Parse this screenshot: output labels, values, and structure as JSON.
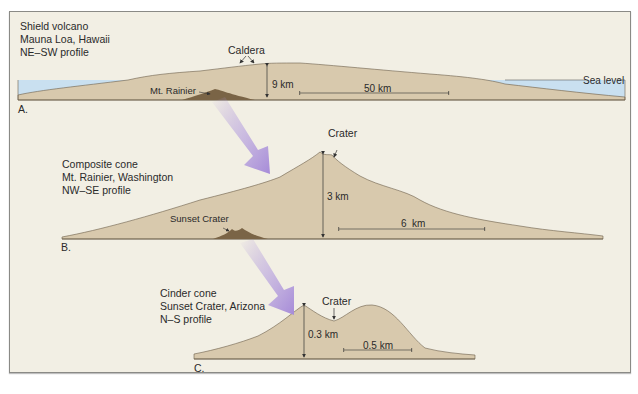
{
  "figure": {
    "panels": [
      {
        "letter": "A.",
        "title_lines": [
          "Shield volcano",
          "Mauna Loa, Hawaii",
          "NE–SW profile"
        ],
        "annotations": {
          "caldera": "Caldera",
          "height": "9 km",
          "width": "50 km",
          "sea_level": "Sea level",
          "inset": "Mt. Rainier"
        }
      },
      {
        "letter": "B.",
        "title_lines": [
          "Composite cone",
          "Mt. Rainier, Washington",
          "NW–SE profile"
        ],
        "annotations": {
          "crater": "Crater",
          "height": "3 km",
          "width": "6  km",
          "inset": "Sunset Crater"
        }
      },
      {
        "letter": "C.",
        "title_lines": [
          "Cinder cone",
          "Sunset Crater, Arizona",
          "N–S profile"
        ],
        "annotations": {
          "crater": "Crater",
          "height": "0.3 km",
          "width": "0.5 km"
        }
      }
    ],
    "colors": {
      "background": "#f2efe4",
      "volcano_fill": "#d8c9ad",
      "inset_fill": "#7a6446",
      "sea": "#c9e0f0",
      "arrow": "#a98fd6",
      "outline": "#6b5e4a"
    }
  }
}
